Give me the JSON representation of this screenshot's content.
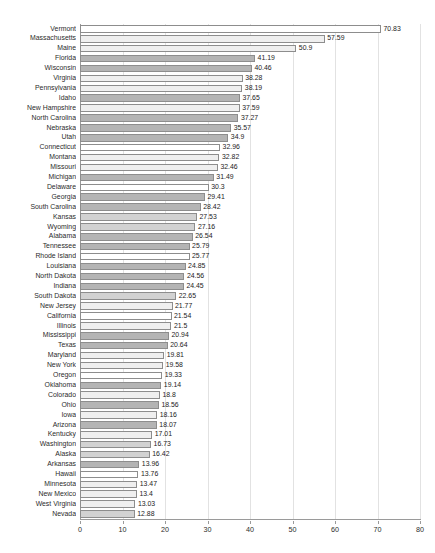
{
  "chart_data": {
    "type": "bar",
    "orientation": "horizontal",
    "title": "",
    "xlabel": "",
    "ylabel": "",
    "xlim": [
      0,
      80
    ],
    "xticks": [
      0,
      10,
      20,
      30,
      40,
      50,
      60,
      70,
      80
    ],
    "grid": true,
    "grid_axis": "x",
    "legend": false,
    "sorted": "descending",
    "categories": [
      "Vermont",
      "Massachusetts",
      "Maine",
      "Florida",
      "Wisconsin",
      "Virginia",
      "Pennsylvania",
      "Idaho",
      "New Hampshire",
      "North Carolina",
      "Nebraska",
      "Utah",
      "Connecticut",
      "Montana",
      "Missouri",
      "Michigan",
      "Delaware",
      "Georgia",
      "South Carolina",
      "Kansas",
      "Wyoming",
      "Alabama",
      "Tennessee",
      "Rhode Island",
      "Louisiana",
      "North Dakota",
      "Indiana",
      "South Dakota",
      "New Jersey",
      "California",
      "Illinois",
      "Mississippi",
      "Texas",
      "Maryland",
      "New York",
      "Oregon",
      "Oklahoma",
      "Colorado",
      "Ohio",
      "Iowa",
      "Arizona",
      "Kentucky",
      "Washington",
      "Alaska",
      "Arkansas",
      "Hawaii",
      "Minnesota",
      "New Mexico",
      "West Virginia",
      "Nevada"
    ],
    "values": [
      70.83,
      57.59,
      50.9,
      41.19,
      40.46,
      38.28,
      38.19,
      37.65,
      37.59,
      37.27,
      35.57,
      34.9,
      32.96,
      32.82,
      32.46,
      31.49,
      30.3,
      29.41,
      28.42,
      27.53,
      27.16,
      26.54,
      25.79,
      25.77,
      24.85,
      24.56,
      24.45,
      22.65,
      21.77,
      21.54,
      21.5,
      20.94,
      20.64,
      19.81,
      19.58,
      19.33,
      19.14,
      18.8,
      18.56,
      18.16,
      18.07,
      17.01,
      16.73,
      16.42,
      13.96,
      13.76,
      13.47,
      13.4,
      13.03,
      12.88
    ],
    "value_labels": [
      "70.83",
      "57.59",
      "50.9",
      "41.19",
      "40.46",
      "38.28",
      "38.19",
      "37.65",
      "37.59",
      "37.27",
      "35.57",
      "34.9",
      "32.96",
      "32.82",
      "32.46",
      "31.49",
      "30.3",
      "29.41",
      "28.42",
      "27.53",
      "27.16",
      "26.54",
      "25.79",
      "25.77",
      "24.85",
      "24.56",
      "24.45",
      "22.65",
      "21.77",
      "21.54",
      "21.5",
      "20.94",
      "20.64",
      "19.81",
      "19.58",
      "19.33",
      "19.14",
      "18.8",
      "18.56",
      "18.16",
      "18.07",
      "17.01",
      "16.73",
      "16.42",
      "13.96",
      "13.76",
      "13.47",
      "13.4",
      "13.03",
      "12.88"
    ],
    "bar_shades": [
      "white",
      "light",
      "light",
      "dark",
      "dark",
      "light",
      "light",
      "dark",
      "light",
      "dark",
      "dark",
      "dark",
      "white",
      "light",
      "light",
      "dark",
      "white",
      "dark",
      "dark",
      "mid",
      "mid",
      "dark",
      "dark",
      "white",
      "dark",
      "dark",
      "dark",
      "mid",
      "light",
      "white",
      "light",
      "dark",
      "dark",
      "light",
      "light",
      "white",
      "dark",
      "light",
      "dark",
      "light",
      "dark",
      "light",
      "mid",
      "mid",
      "dark",
      "white",
      "light",
      "light",
      "light",
      "mid"
    ],
    "colors": {
      "bar_white": "#ffffff",
      "bar_light": "#efefef",
      "bar_mid": "#d2d2d2",
      "bar_dark": "#b4b4b4",
      "bar_outline": "#8d8d8d",
      "gridline": "#e2e2e2",
      "axis": "#9a9a9a",
      "text": "#2b2b2b",
      "background": "#ffffff"
    }
  }
}
